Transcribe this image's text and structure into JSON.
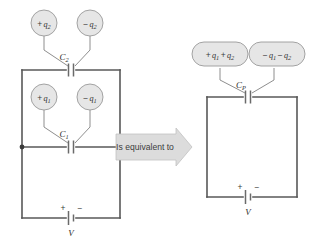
{
  "diagram": {
    "background": "#ffffff",
    "wire_color": "#585858",
    "leader_color": "#8e8e8e",
    "bubble_fill": "#e6e6e6",
    "bubble_stroke": "#9a9a9a",
    "arrow_fill": "#dcdcdc"
  },
  "left_circuit": {
    "name": "two-capacitors-in-parallel",
    "charge_labels": [
      {
        "id": "plus-q2",
        "sign": "+",
        "base": "q",
        "sub": "2",
        "text": "+ q2"
      },
      {
        "id": "minus-q2",
        "sign": "−",
        "base": "q",
        "sub": "2",
        "text": "− q2"
      },
      {
        "id": "plus-q1",
        "sign": "+",
        "base": "q",
        "sub": "1",
        "text": "+ q1"
      },
      {
        "id": "minus-q1",
        "sign": "−",
        "base": "q",
        "sub": "1",
        "text": "− q1"
      }
    ],
    "capacitors": [
      {
        "id": "C2",
        "base": "C",
        "sub": "2",
        "text": "C2"
      },
      {
        "id": "C1",
        "base": "C",
        "sub": "1",
        "text": "C1"
      }
    ],
    "battery": {
      "id": "battery-left",
      "label": "V",
      "plus": "+",
      "minus": "−"
    }
  },
  "connector": {
    "name": "is-equivalent-to-arrow",
    "text": "Is equivalent to",
    "direction": "right"
  },
  "right_circuit": {
    "name": "equivalent-parallel-capacitor",
    "charge_labels": [
      {
        "id": "plus-q1-plus-q2",
        "text": "+ q1 + q2",
        "parts": [
          "+",
          "q",
          "1",
          "+",
          "q",
          "2"
        ]
      },
      {
        "id": "minus-q1-minus-q2",
        "text": "− q1 − q2",
        "parts": [
          "−",
          "q",
          "1",
          "−",
          "q",
          "2"
        ]
      }
    ],
    "capacitor": {
      "id": "CP",
      "base": "C",
      "sub": "P",
      "text": "CP"
    },
    "battery": {
      "id": "battery-right",
      "label": "V",
      "plus": "+",
      "minus": "−"
    }
  }
}
